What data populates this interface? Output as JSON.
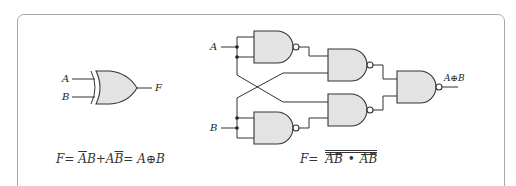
{
  "diagram": {
    "type": "logic-circuit",
    "left_panel": {
      "title": "XOR gate symbol",
      "inputs": [
        "A",
        "B"
      ],
      "output": "F",
      "equation": {
        "lhs": "F=",
        "term1_bar": "A",
        "term1_plain": "B",
        "plus": "+",
        "term2_plain": "A",
        "term2_bar": "B",
        "equals": "=",
        "result": "A⊕B"
      }
    },
    "right_panel": {
      "title": "XOR built from four NAND gates",
      "inputs": [
        "A",
        "B"
      ],
      "output_label": "A⊕B",
      "gates": [
        {
          "id": "nand1",
          "type": "NAND",
          "inputs": [
            "A",
            "A"
          ],
          "output": "A̅"
        },
        {
          "id": "nand2",
          "type": "NAND",
          "inputs": [
            "B",
            "B"
          ],
          "output": "B̅"
        },
        {
          "id": "nand3",
          "type": "NAND",
          "inputs": [
            "A̅",
            "B"
          ]
        },
        {
          "id": "nand4",
          "type": "NAND",
          "inputs": [
            "A",
            "B̅"
          ]
        },
        {
          "id": "nand5",
          "type": "NAND",
          "inputs": [
            "nand3",
            "nand4"
          ],
          "output": "A⊕B"
        }
      ],
      "equation": {
        "lhs": "F=",
        "term1": "AB",
        "dot": "•",
        "term2": "AB"
      }
    }
  }
}
